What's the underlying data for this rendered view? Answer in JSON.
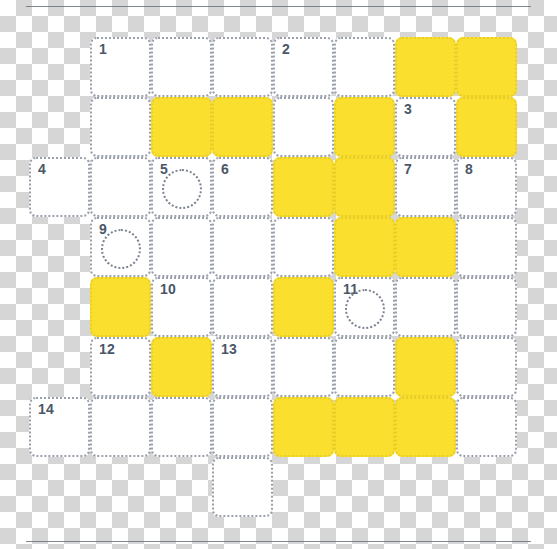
{
  "app": {
    "title": "Crossword Puzzle Grid",
    "canvas_width": 557,
    "canvas_height": 549
  },
  "style": {
    "fill_color": "#fadf2e",
    "empty_color": "#ffffff",
    "border_color": "#9aa1ad",
    "number_color": "#4a5768",
    "rule_color": "#6b7280"
  },
  "rules": {
    "top_label": "top-divider",
    "bottom_label": "bottom-divider"
  },
  "grid": {
    "columns": 8,
    "rows": 8,
    "cell_width": 61,
    "cell_height": 60,
    "origin_x": 29,
    "origin_y": 37,
    "max_clue_number": 14,
    "cells": [
      {
        "row": 0,
        "col": 1,
        "fill": "empty",
        "number": "1",
        "circle": false
      },
      {
        "row": 0,
        "col": 2,
        "fill": "empty",
        "number": "",
        "circle": false
      },
      {
        "row": 0,
        "col": 3,
        "fill": "empty",
        "number": "",
        "circle": false
      },
      {
        "row": 0,
        "col": 4,
        "fill": "empty",
        "number": "2",
        "circle": false
      },
      {
        "row": 0,
        "col": 5,
        "fill": "empty",
        "number": "",
        "circle": false
      },
      {
        "row": 0,
        "col": 6,
        "fill": "filled",
        "number": "",
        "circle": false
      },
      {
        "row": 0,
        "col": 7,
        "fill": "filled",
        "number": "",
        "circle": false
      },
      {
        "row": 1,
        "col": 1,
        "fill": "empty",
        "number": "",
        "circle": false
      },
      {
        "row": 1,
        "col": 2,
        "fill": "filled",
        "number": "",
        "circle": false
      },
      {
        "row": 1,
        "col": 3,
        "fill": "filled",
        "number": "",
        "circle": false
      },
      {
        "row": 1,
        "col": 4,
        "fill": "empty",
        "number": "",
        "circle": false
      },
      {
        "row": 1,
        "col": 5,
        "fill": "filled",
        "number": "",
        "circle": false
      },
      {
        "row": 1,
        "col": 6,
        "fill": "empty",
        "number": "3",
        "circle": false
      },
      {
        "row": 1,
        "col": 7,
        "fill": "filled",
        "number": "",
        "circle": false
      },
      {
        "row": 2,
        "col": 0,
        "fill": "empty",
        "number": "4",
        "circle": false
      },
      {
        "row": 2,
        "col": 1,
        "fill": "empty",
        "number": "",
        "circle": false
      },
      {
        "row": 2,
        "col": 2,
        "fill": "empty",
        "number": "5",
        "circle": true
      },
      {
        "row": 2,
        "col": 3,
        "fill": "empty",
        "number": "6",
        "circle": false
      },
      {
        "row": 2,
        "col": 4,
        "fill": "filled",
        "number": "",
        "circle": false
      },
      {
        "row": 2,
        "col": 5,
        "fill": "filled",
        "number": "",
        "circle": false
      },
      {
        "row": 2,
        "col": 6,
        "fill": "empty",
        "number": "7",
        "circle": false
      },
      {
        "row": 2,
        "col": 7,
        "fill": "empty",
        "number": "8",
        "circle": false
      },
      {
        "row": 3,
        "col": 1,
        "fill": "empty",
        "number": "9",
        "circle": true
      },
      {
        "row": 3,
        "col": 2,
        "fill": "empty",
        "number": "",
        "circle": false
      },
      {
        "row": 3,
        "col": 3,
        "fill": "empty",
        "number": "",
        "circle": false
      },
      {
        "row": 3,
        "col": 4,
        "fill": "empty",
        "number": "",
        "circle": false
      },
      {
        "row": 3,
        "col": 5,
        "fill": "filled",
        "number": "",
        "circle": false
      },
      {
        "row": 3,
        "col": 6,
        "fill": "filled",
        "number": "",
        "circle": false
      },
      {
        "row": 3,
        "col": 7,
        "fill": "empty",
        "number": "",
        "circle": false
      },
      {
        "row": 4,
        "col": 1,
        "fill": "filled",
        "number": "",
        "circle": false
      },
      {
        "row": 4,
        "col": 2,
        "fill": "empty",
        "number": "10",
        "circle": false
      },
      {
        "row": 4,
        "col": 3,
        "fill": "empty",
        "number": "",
        "circle": false
      },
      {
        "row": 4,
        "col": 4,
        "fill": "filled",
        "number": "",
        "circle": false
      },
      {
        "row": 4,
        "col": 5,
        "fill": "empty",
        "number": "11",
        "circle": true
      },
      {
        "row": 4,
        "col": 6,
        "fill": "empty",
        "number": "",
        "circle": false
      },
      {
        "row": 4,
        "col": 7,
        "fill": "empty",
        "number": "",
        "circle": false
      },
      {
        "row": 5,
        "col": 1,
        "fill": "empty",
        "number": "12",
        "circle": false
      },
      {
        "row": 5,
        "col": 2,
        "fill": "filled",
        "number": "",
        "circle": false
      },
      {
        "row": 5,
        "col": 3,
        "fill": "empty",
        "number": "13",
        "circle": false
      },
      {
        "row": 5,
        "col": 4,
        "fill": "empty",
        "number": "",
        "circle": false
      },
      {
        "row": 5,
        "col": 5,
        "fill": "empty",
        "number": "",
        "circle": false
      },
      {
        "row": 5,
        "col": 6,
        "fill": "filled",
        "number": "",
        "circle": false
      },
      {
        "row": 5,
        "col": 7,
        "fill": "empty",
        "number": "",
        "circle": false
      },
      {
        "row": 6,
        "col": 0,
        "fill": "empty",
        "number": "14",
        "circle": false
      },
      {
        "row": 6,
        "col": 1,
        "fill": "empty",
        "number": "",
        "circle": false
      },
      {
        "row": 6,
        "col": 2,
        "fill": "empty",
        "number": "",
        "circle": false
      },
      {
        "row": 6,
        "col": 3,
        "fill": "empty",
        "number": "",
        "circle": false
      },
      {
        "row": 6,
        "col": 4,
        "fill": "filled",
        "number": "",
        "circle": false
      },
      {
        "row": 6,
        "col": 5,
        "fill": "filled",
        "number": "",
        "circle": false
      },
      {
        "row": 6,
        "col": 6,
        "fill": "filled",
        "number": "",
        "circle": false
      },
      {
        "row": 6,
        "col": 7,
        "fill": "empty",
        "number": "",
        "circle": false
      },
      {
        "row": 7,
        "col": 3,
        "fill": "empty",
        "number": "",
        "circle": false
      }
    ]
  }
}
